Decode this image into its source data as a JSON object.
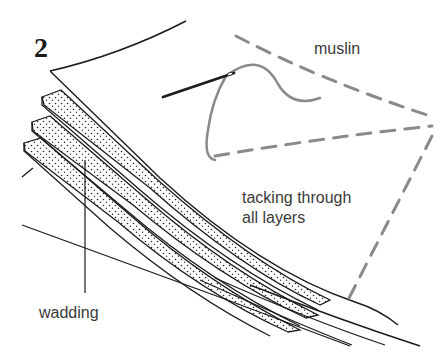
{
  "figure": {
    "step_number": "2",
    "labels": {
      "muslin": "muslin",
      "tacking_line1": "tacking through",
      "tacking_line2": "all layers",
      "wadding": "wadding"
    },
    "colors": {
      "ink": "#1c1c1c",
      "tacking_thread": "#8a8a8a",
      "paper": "#ffffff",
      "label_text": "#3a3a3a"
    },
    "layers": [
      "muslin (top sheet)",
      "wadding layer 1",
      "wadding layer 2",
      "wadding layer 3",
      "backing"
    ]
  }
}
